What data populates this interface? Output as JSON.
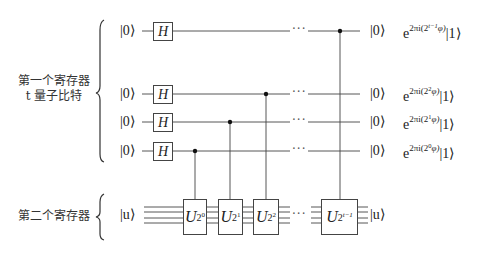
{
  "registers": {
    "first": {
      "label_line1": "第一个寄存器",
      "label_line2": "t 量子比特"
    },
    "second": {
      "label": "第二个寄存器"
    }
  },
  "qubits": [
    {
      "input": "|0⟩",
      "gate": "H",
      "output": "|0⟩",
      "phase_exp": "2πi(2",
      "phase_sup": "t−1",
      "phase_tail": "φ)",
      "phase_suffix": "|1⟩"
    },
    {
      "input": "|0⟩",
      "gate": "H",
      "output": "|0⟩",
      "phase_exp": "2πi(2",
      "phase_sup": "2",
      "phase_tail": "φ)",
      "phase_suffix": "|1⟩"
    },
    {
      "input": "|0⟩",
      "gate": "H",
      "output": "|0⟩",
      "phase_exp": "2πi(2",
      "phase_sup": "1",
      "phase_tail": "φ)",
      "phase_suffix": "|1⟩"
    },
    {
      "input": "|0⟩",
      "gate": "H",
      "output": "|0⟩",
      "phase_exp": "2πi(2",
      "phase_sup": "0",
      "phase_tail": "φ)",
      "phase_suffix": "|1⟩"
    }
  ],
  "second_register": {
    "input": "|u⟩",
    "output": "|u⟩"
  },
  "controlled_unitaries": [
    {
      "base": "U",
      "exp_base": "2",
      "exp_sup": "0"
    },
    {
      "base": "U",
      "exp_base": "2",
      "exp_sup": "1"
    },
    {
      "base": "U",
      "exp_base": "2",
      "exp_sup": "2"
    },
    {
      "base": "U",
      "exp_base": "2",
      "exp_sup": "t−1"
    }
  ],
  "ellipsis": "···",
  "phase_base": "e"
}
